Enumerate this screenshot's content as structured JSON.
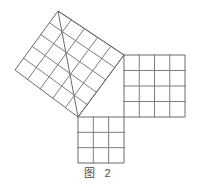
{
  "figure": {
    "caption": "图 2",
    "caption_label": "图",
    "caption_number": "2",
    "background_color": "#ffffff",
    "line_color": "#7d7d7d",
    "line_color_outer": "#6b6b6b",
    "caption_color": "#4a4a4a",
    "stroke_width": 1
  },
  "chart_data": {
    "type": "diagram",
    "title": "图 2",
    "triangle": {
      "name": "right-triangle",
      "vertices": [
        {
          "label": "right-angle-vertex",
          "x": 124,
          "y": 55
        },
        {
          "label": "bottom-left-vertex",
          "x": 78,
          "y": 117
        },
        {
          "label": "top-left-vertex",
          "x": 58,
          "y": 11
        }
      ],
      "legs": [
        3,
        4
      ],
      "hypotenuse": 5
    },
    "squares": [
      {
        "name": "hypotenuse-square",
        "position": "upper-left-tilted",
        "grid": 5,
        "cells": 25,
        "side_length": 5,
        "rotated": true,
        "corners": [
          {
            "x": 124,
            "y": 55
          },
          {
            "x": 58,
            "y": 11
          },
          {
            "x": 15,
            "y": 70
          },
          {
            "x": 78,
            "y": 117
          }
        ]
      },
      {
        "name": "long-leg-square",
        "position": "right",
        "grid": 4,
        "cells": 16,
        "side_length": 4,
        "rotated": false,
        "corners": [
          {
            "x": 124,
            "y": 55
          },
          {
            "x": 185,
            "y": 55
          },
          {
            "x": 185,
            "y": 117
          },
          {
            "x": 124,
            "y": 117
          }
        ]
      },
      {
        "name": "short-leg-square",
        "position": "bottom",
        "grid": 3,
        "cells": 9,
        "side_length": 3,
        "rotated": false,
        "corners": [
          {
            "x": 78,
            "y": 117
          },
          {
            "x": 124,
            "y": 117
          },
          {
            "x": 124,
            "y": 163
          },
          {
            "x": 78,
            "y": 163
          }
        ]
      }
    ],
    "xlabel": "",
    "ylabel": "",
    "legend": []
  }
}
